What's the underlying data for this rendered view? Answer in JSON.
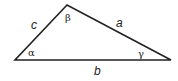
{
  "diagram": {
    "type": "triangle",
    "vertices": {
      "apex": [
        67,
        5
      ],
      "left": [
        15,
        60
      ],
      "right": [
        171,
        60
      ]
    },
    "stroke_color": "#222222",
    "sides": [
      {
        "name": "a",
        "label": "a",
        "pos": [
          116,
          27
        ]
      },
      {
        "name": "b",
        "label": "b",
        "pos": [
          94,
          75
        ]
      },
      {
        "name": "c",
        "label": "c",
        "pos": [
          31,
          29
        ]
      }
    ],
    "angles": [
      {
        "name": "alpha",
        "label": "α",
        "pos": [
          28,
          56
        ]
      },
      {
        "name": "beta",
        "label": "β",
        "pos": [
          65,
          21
        ]
      },
      {
        "name": "gamma",
        "label": "γ",
        "pos": [
          138,
          57
        ]
      }
    ]
  }
}
